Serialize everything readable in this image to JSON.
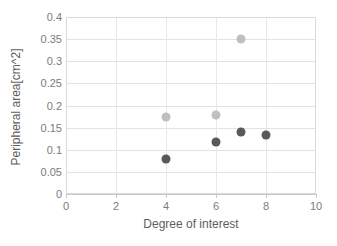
{
  "chart_data": {
    "type": "scatter",
    "title": "",
    "xlabel": "Degree of interest",
    "ylabel": "Peripheral area[cm^2]",
    "xlim": [
      0,
      10
    ],
    "ylim": [
      0,
      0.4
    ],
    "grid": true,
    "legend": "none",
    "x_ticks": [
      "0",
      "2",
      "4",
      "6",
      "8",
      "10"
    ],
    "x_tick_values": [
      0,
      2,
      4,
      6,
      8,
      10
    ],
    "y_ticks": [
      "0",
      "0.05",
      "0.1",
      "0.15",
      "0.2",
      "0.25",
      "0.3",
      "0.35",
      "0.4"
    ],
    "y_tick_values": [
      0,
      0.05,
      0.1,
      0.15,
      0.2,
      0.25,
      0.3,
      0.35,
      0.4
    ],
    "series": [
      {
        "name": "series-light",
        "color": "#bfbfbf",
        "points": [
          {
            "x": 4,
            "y": 0.173
          },
          {
            "x": 6,
            "y": 0.178
          },
          {
            "x": 7,
            "y": 0.35
          }
        ]
      },
      {
        "name": "series-dark",
        "color": "#595959",
        "points": [
          {
            "x": 4,
            "y": 0.08
          },
          {
            "x": 6,
            "y": 0.117
          },
          {
            "x": 7,
            "y": 0.141
          },
          {
            "x": 8,
            "y": 0.134
          }
        ]
      }
    ]
  },
  "colors": {
    "light_marker": "#bfbfbf",
    "dark_marker": "#595959",
    "gridline": "#e2e2e2",
    "axis": "#c9c9c9",
    "text": "#7c7c7c",
    "background": "#ffffff"
  }
}
